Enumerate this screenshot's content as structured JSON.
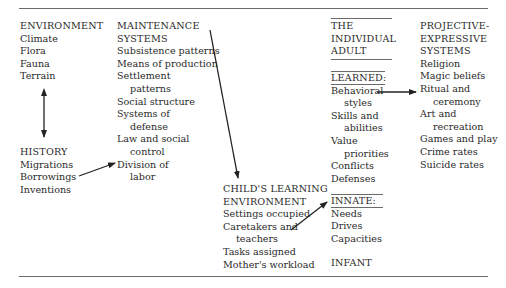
{
  "environment": {
    "title": "ENVIRONMENT",
    "items": [
      "Climate",
      "Flora",
      "Fauna",
      "Terrain"
    ]
  },
  "history": {
    "title": "HISTORY",
    "items": [
      "Migrations",
      "Borrowings",
      "Inventions"
    ]
  },
  "maintenance": {
    "title_1": "MAINTENANCE",
    "title_2": "SYSTEMS",
    "items": [
      "Subsistence patterns",
      "Means of production",
      "Settlement",
      "patterns",
      "Social structure",
      "Systems of",
      "defense",
      "Law and social",
      "control",
      "Division of",
      "labor"
    ]
  },
  "child": {
    "title_1": "CHILD'S LEARNING",
    "title_2": "ENVIRONMENT",
    "items": [
      "Settings occupied",
      "Caretakers and",
      "teachers",
      "Tasks assigned",
      "Mother's workload"
    ]
  },
  "individual": {
    "title_1": "THE",
    "title_2": "INDIVIDUAL",
    "title_3": "ADULT",
    "learned_label": "LEARNED:",
    "learned": [
      "Behavioral",
      "styles",
      "Skills and",
      "abilities",
      "Value",
      "priorities",
      "Conflicts",
      "Defenses"
    ],
    "innate_label": "INNATE:",
    "innate": [
      "Needs",
      "Drives",
      "Capacities"
    ],
    "infant": "INFANT"
  },
  "projective": {
    "title_1": "PROJECTIVE-",
    "title_2": "EXPRESSIVE",
    "title_3": "SYSTEMS",
    "items": [
      "Religion",
      "Magic beliefs",
      "Ritual and",
      "ceremony",
      "Art and",
      "recreation",
      "Games and play",
      "Crime rates",
      "Suicide rates"
    ]
  }
}
